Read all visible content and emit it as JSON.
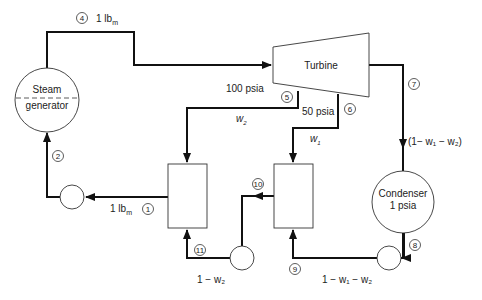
{
  "components": {
    "steam_generator": {
      "line1": "Steam",
      "line2": "generator"
    },
    "turbine": {
      "label": "Turbine"
    },
    "condenser": {
      "line1": "Condenser",
      "line2": "1 psia"
    }
  },
  "states": [
    "1",
    "2",
    "4",
    "5",
    "6",
    "7",
    "8",
    "9",
    "10",
    "11"
  ],
  "labels": {
    "flow_top": "1 lb",
    "flow_top_sub": "m",
    "flow_1": "1 lb",
    "flow_1_sub": "m",
    "p_extract_high": "100 psia",
    "p_extract_low": "50 psia",
    "w2": "w",
    "w2_sub": "2",
    "w1": "w",
    "w1_sub": "1",
    "to_condenser": "(1− w₁ − w₂)",
    "after_pump_mid": "1 − w₂",
    "after_pump_right": "1 − w₁ − w₂"
  },
  "colors": {
    "line": "#111111",
    "background": "#ffffff"
  }
}
